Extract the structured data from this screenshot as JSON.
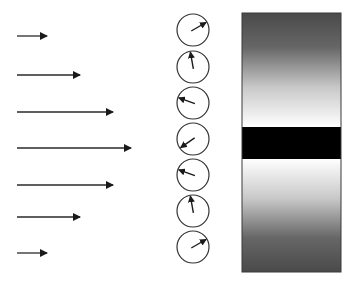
{
  "diagram": {
    "colors": {
      "line": "#2a2a2a",
      "clock_stroke": "#333333",
      "bar_dark": "#4a4a4a",
      "bar_light": "#ffffff",
      "band": "#000000"
    },
    "arrows": [
      {
        "y": 36,
        "x_start": 17,
        "x_end": 47
      },
      {
        "y": 75,
        "x_start": 17,
        "x_end": 80
      },
      {
        "y": 112,
        "x_start": 17,
        "x_end": 113
      },
      {
        "y": 148,
        "x_start": 17,
        "x_end": 131
      },
      {
        "y": 185,
        "x_start": 17,
        "x_end": 113
      },
      {
        "y": 217,
        "x_start": 17,
        "x_end": 80
      },
      {
        "y": 253,
        "x_start": 17,
        "x_end": 47
      }
    ],
    "clocks": [
      {
        "cx": 193,
        "cy": 30,
        "r": 16,
        "hand_angle_deg": 60
      },
      {
        "cx": 193,
        "cy": 67,
        "r": 16,
        "hand_angle_deg": -10
      },
      {
        "cx": 193,
        "cy": 103,
        "r": 16,
        "hand_angle_deg": -70
      },
      {
        "cx": 193,
        "cy": 139,
        "r": 16,
        "hand_angle_deg": -125
      },
      {
        "cx": 193,
        "cy": 175,
        "r": 16,
        "hand_angle_deg": -70
      },
      {
        "cx": 193,
        "cy": 211,
        "r": 16,
        "hand_angle_deg": -10
      },
      {
        "cx": 193,
        "cy": 247,
        "r": 16,
        "hand_angle_deg": 60
      }
    ],
    "bar": {
      "x": 242,
      "y": 13,
      "width": 99,
      "height": 259
    },
    "band": {
      "y": 127,
      "height": 32
    }
  }
}
